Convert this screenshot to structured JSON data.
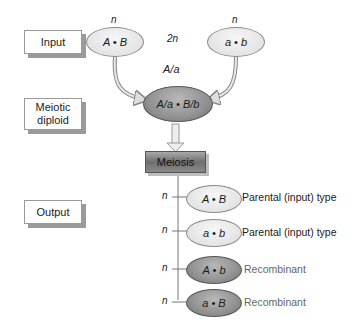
{
  "labels": {
    "input": "Input",
    "meiotic_diploid": "Meiotic diploid",
    "output": "Output"
  },
  "inputs": [
    {
      "ploidy": "n",
      "genotype": "A • B"
    },
    {
      "ploidy": "n",
      "genotype": "a • b"
    }
  ],
  "diploid": {
    "ploidy": "2n",
    "intermediate": "A/a",
    "genotype": "A/a • B/b"
  },
  "process": {
    "label": "Meiosis"
  },
  "outputs": [
    {
      "ploidy": "n",
      "genotype": "A • B",
      "type": "Parental (input) type",
      "shade": "light"
    },
    {
      "ploidy": "n",
      "genotype": "a • b",
      "type": "Parental (input) type",
      "shade": "light"
    },
    {
      "ploidy": "n",
      "genotype": "A • b",
      "type": "Recombinant",
      "shade": "dark"
    },
    {
      "ploidy": "n",
      "genotype": "a • B",
      "type": "Recombinant",
      "shade": "dark"
    }
  ],
  "colors": {
    "light_fill": "#e4e4e4",
    "dark_fill": "#8e8e8e",
    "recombinant_text": "#666666",
    "outline": "#8a8a8a"
  }
}
